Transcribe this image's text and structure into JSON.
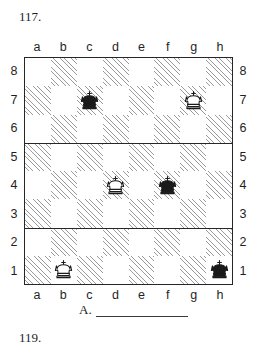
{
  "problems": {
    "current_number": "117.",
    "next_number": "119."
  },
  "board": {
    "files": [
      "a",
      "b",
      "c",
      "d",
      "e",
      "f",
      "g",
      "h"
    ],
    "ranks": [
      "8",
      "7",
      "6",
      "5",
      "4",
      "3",
      "2",
      "1"
    ],
    "light_square_color": "#ffffff",
    "shaded_square_hatch_color": "#9a9a9a",
    "border_color": "#262626",
    "pieces": [
      {
        "square": "c7",
        "type": "king",
        "color": "black",
        "glyph": "♚"
      },
      {
        "square": "g7",
        "type": "king",
        "color": "white",
        "glyph": "♔"
      },
      {
        "square": "d4",
        "type": "king",
        "color": "white",
        "glyph": "♔"
      },
      {
        "square": "f4",
        "type": "king",
        "color": "black",
        "glyph": "♚"
      },
      {
        "square": "b1",
        "type": "king",
        "color": "white",
        "glyph": "♔"
      },
      {
        "square": "h1",
        "type": "king",
        "color": "black",
        "glyph": "♚"
      }
    ]
  },
  "answer": {
    "label": "A.",
    "value": ""
  }
}
